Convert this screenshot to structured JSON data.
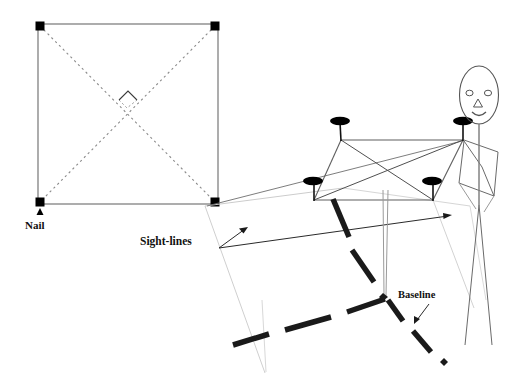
{
  "figure": {
    "background_color": "#ffffff",
    "width": 525,
    "height": 386
  },
  "labels": {
    "nail": "Nail",
    "sight_lines": "Sight-lines",
    "baseline": "Baseline"
  },
  "colors": {
    "ink": "#111111",
    "frame_line": "#7d7d7d",
    "dotted_diagonal": "#8a8a8a",
    "construction_line": "#c9c9c9",
    "thick_dash": "#1a1a1a",
    "nail_head": "#000000",
    "figure_outline": "#4a4a4a"
  },
  "plan_view": {
    "description": "Square plan of the nail frame seen from above with dotted diagonals",
    "square": {
      "x": 38,
      "y": 24,
      "width": 180,
      "height": 180
    },
    "corner_nails": [
      {
        "name": "top-left",
        "x": 40,
        "y": 26
      },
      {
        "name": "top-right",
        "x": 215,
        "y": 26
      },
      {
        "name": "bottom-left",
        "x": 40,
        "y": 202
      },
      {
        "name": "bottom-right",
        "x": 215,
        "y": 202
      }
    ],
    "nail_marker_size": 9,
    "diagonals": [
      {
        "from": [
          40,
          26
        ],
        "to": [
          215,
          202
        ]
      },
      {
        "from": [
          215,
          26
        ],
        "to": [
          40,
          202
        ]
      }
    ],
    "right_angle_marker": {
      "center": [
        128,
        107
      ],
      "size": 17
    },
    "nail_callout": {
      "arrow_x": 42,
      "arrow_y": 210,
      "text_x": 26,
      "text_y": 229
    }
  },
  "perspective_view": {
    "description": "Person holding the square nail frame tilted in perspective",
    "frame_nails": [
      {
        "name": "far-left-top",
        "head_x": 339,
        "head_y": 122,
        "stem_bottom_y": 140
      },
      {
        "name": "far-right-top",
        "head_x": 464,
        "head_y": 122,
        "stem_bottom_y": 140
      },
      {
        "name": "near-left-bottom",
        "head_x": 313,
        "head_y": 182,
        "stem_bottom_y": 200
      },
      {
        "name": "near-right-bottom",
        "head_x": 432,
        "head_y": 182,
        "stem_bottom_y": 200
      }
    ],
    "frame_edges": [
      {
        "from": [
          341,
          140
        ],
        "to": [
          463,
          140
        ]
      },
      {
        "from": [
          341,
          140
        ],
        "to": [
          314,
          200
        ]
      },
      {
        "from": [
          463,
          140
        ],
        "to": [
          433,
          200
        ]
      },
      {
        "from": [
          314,
          200
        ],
        "to": [
          433,
          200
        ]
      }
    ],
    "frame_diagonals": [
      {
        "from": [
          341,
          140
        ],
        "to": [
          433,
          200
        ]
      },
      {
        "from": [
          463,
          140
        ],
        "to": [
          314,
          200
        ]
      }
    ],
    "post": {
      "x_left": 383,
      "x_right": 387,
      "top_y": 190,
      "bottom_y": 297
    }
  },
  "person": {
    "head": {
      "cx": 479,
      "cy": 95,
      "rx": 20,
      "ry": 29
    },
    "eyes": [
      {
        "cx": 470,
        "cy": 93,
        "rx": 3.4,
        "ry": 2.6
      },
      {
        "cx": 488,
        "cy": 93,
        "rx": 3.4,
        "ry": 2.6
      }
    ],
    "nose": {
      "cx": 478,
      "cy": 103,
      "size": 7
    },
    "mouth": {
      "cx": 479,
      "cy": 113,
      "width": 13
    },
    "neck": {
      "from": [
        479,
        124
      ],
      "to": [
        479,
        142
      ]
    },
    "arm_path": "M 464 140 L 481 168 L 492 197 L 459 183 Z",
    "shoulder_line": {
      "from": [
        464,
        140
      ],
      "to": [
        497,
        150
      ]
    },
    "legs": [
      {
        "from": [
          479,
          150
        ],
        "to": [
          466,
          340
        ]
      },
      {
        "from": [
          479,
          150
        ],
        "to": [
          492,
          340
        ]
      }
    ],
    "body_line": {
      "from": [
        479,
        142
      ],
      "to": [
        479,
        200
      ]
    }
  },
  "sight_lines": {
    "label_position": {
      "x": 140,
      "y": 244
    },
    "callout_origin": [
      219,
      248
    ],
    "arrows": [
      {
        "to": [
          248,
          228
        ],
        "name": "upper-sight-arrow"
      },
      {
        "to": [
          451,
          215
        ],
        "name": "lower-sight-arrow"
      }
    ],
    "rays": [
      {
        "from": [
          205,
          205
        ],
        "to": [
          463,
          140
        ],
        "name": "ray-to-far-right-nail"
      },
      {
        "from": [
          219,
          248
        ],
        "to": [
          451,
          215
        ],
        "name": "ray-long-right"
      }
    ]
  },
  "baseline": {
    "label_position": {
      "x": 398,
      "y": 297
    },
    "callout_arrow": {
      "from": [
        431,
        303
      ],
      "to": [
        415,
        322
      ]
    },
    "vertex": [
      385,
      297
    ],
    "thick_dashes": [
      {
        "from": [
          333,
          199
        ],
        "to": [
          348,
          236
        ],
        "name": "dash-upper-1"
      },
      {
        "from": [
          348,
          248
        ],
        "to": [
          372,
          279
        ],
        "name": "dash-upper-2"
      },
      {
        "from": [
          385,
          297
        ],
        "to": [
          348,
          310
        ],
        "name": "dash-left-1"
      },
      {
        "from": [
          330,
          316
        ],
        "to": [
          283,
          329
        ],
        "name": "dash-left-2"
      },
      {
        "from": [
          268,
          332
        ],
        "to": [
          232,
          344
        ],
        "name": "dash-left-3"
      },
      {
        "from": [
          388,
          299
        ],
        "to": [
          404,
          320
        ],
        "name": "dash-right-1"
      },
      {
        "from": [
          414,
          330
        ],
        "to": [
          432,
          352
        ],
        "name": "dash-right-2"
      },
      {
        "from": [
          444,
          360
        ],
        "to": [
          448,
          364
        ],
        "name": "dash-right-dot"
      }
    ],
    "dash_thickness": 5
  },
  "construction_lines": [
    {
      "from": [
        205,
        205
      ],
      "to": [
        265,
        373
      ],
      "name": "vertical-guide-left"
    },
    {
      "from": [
        432,
        200
      ],
      "to": [
        470,
        300
      ],
      "name": "guide-right-down"
    },
    {
      "from": [
        205,
        206
      ],
      "to": [
        300,
        196
      ],
      "name": "guide-horizon"
    }
  ]
}
